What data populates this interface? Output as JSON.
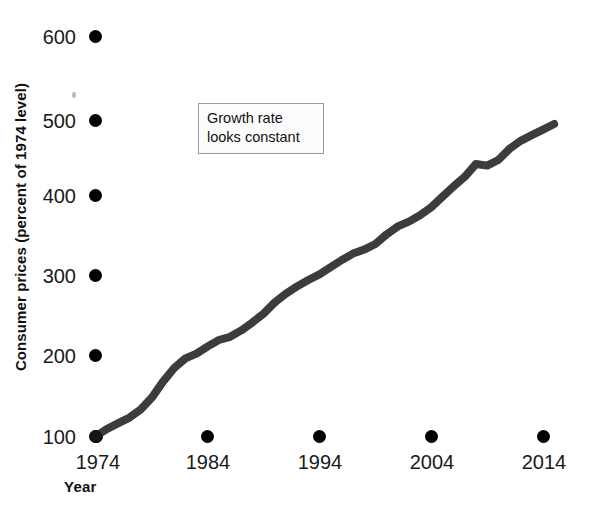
{
  "chart_data": {
    "type": "line",
    "title": "",
    "xlabel": "Year",
    "ylabel": "Consumer prices (percent of 1974 level)",
    "xlim": [
      1974,
      2015
    ],
    "ylim": [
      100,
      600
    ],
    "grid": false,
    "legend_position": "none",
    "xticks": [
      "1974",
      "1984",
      "1994",
      "2004",
      "2014"
    ],
    "xtick_values": [
      1974,
      1984,
      1994,
      2004,
      2014
    ],
    "yticks": [
      "100",
      "200",
      "300",
      "400",
      "500",
      "600"
    ],
    "ytick_values": [
      100,
      200,
      300,
      400,
      500,
      600
    ],
    "annotations": [
      {
        "text_line_1": "Growth rate",
        "text_line_2": "looks constant",
        "x": 1983,
        "y": 520
      }
    ],
    "series": [
      {
        "name": "Consumer prices (percent of 1974 level)",
        "color": "#3c3c3c",
        "x": [
          1974,
          1975,
          1976,
          1977,
          1978,
          1979,
          1980,
          1981,
          1982,
          1983,
          1984,
          1985,
          1986,
          1987,
          1988,
          1989,
          1990,
          1991,
          1992,
          1993,
          1994,
          1995,
          1996,
          1997,
          1998,
          1999,
          2000,
          2001,
          2002,
          2003,
          2004,
          2005,
          2006,
          2007,
          2008,
          2009,
          2010,
          2011,
          2012,
          2013,
          2014,
          2015
        ],
        "values": [
          100,
          109,
          116,
          123,
          133,
          148,
          168,
          185,
          197,
          203,
          212,
          220,
          224,
          232,
          242,
          253,
          267,
          278,
          287,
          295,
          302,
          311,
          320,
          328,
          333,
          340,
          352,
          362,
          368,
          376,
          386,
          399,
          412,
          424,
          440,
          438,
          445,
          459,
          469,
          476,
          483,
          490
        ]
      }
    ]
  },
  "axis": {
    "y_title": "Consumer prices (percent of 1974 level)",
    "x_title": "Year"
  },
  "callout": {
    "line1": "Growth rate",
    "line2": "looks constant"
  },
  "ticks": {
    "y": [
      {
        "label": "600"
      },
      {
        "label": "500"
      },
      {
        "label": "400"
      },
      {
        "label": "300"
      },
      {
        "label": "200"
      },
      {
        "label": "100"
      }
    ],
    "x": [
      {
        "label": "1974"
      },
      {
        "label": "1984"
      },
      {
        "label": "1994"
      },
      {
        "label": "2004"
      },
      {
        "label": "2014"
      }
    ]
  },
  "colors": {
    "line": "#3c3c3c",
    "tick_marker": "#000000",
    "callout_border": "#9a9a9a",
    "callout_fill": "#fbfbfb",
    "text": "#111111",
    "background": "#ffffff"
  }
}
